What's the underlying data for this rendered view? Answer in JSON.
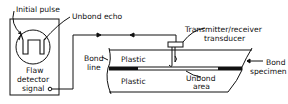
{
  "diagram": {
    "type": "ultrasonic pulse-echo bond inspection schematic",
    "colors": {
      "line": "#111111",
      "background": "#ffffff"
    },
    "labels": {
      "initial_pulse": "Initial pulse",
      "unbond_echo": "Unbond echo",
      "flaw_detector_line1": "Flaw",
      "flaw_detector_line2": "detector",
      "flaw_detector_line3": "signal",
      "transducer_line1": "Transmitter/receiver",
      "transducer_line2": "transducer",
      "bond_line_line1": "Bond",
      "bond_line_line2": "line",
      "plastic_top": "Plastic",
      "plastic_bottom": "Plastic",
      "unbond_area_line1": "Unbond",
      "unbond_area_line2": "area",
      "bond_specimen_line1": "Bond",
      "bond_specimen_line2": "specimen"
    },
    "icons": {
      "display": "flaw-detector-screen-icon",
      "transducer": "transducer-icon",
      "connector": "signal-connector-icon"
    }
  }
}
